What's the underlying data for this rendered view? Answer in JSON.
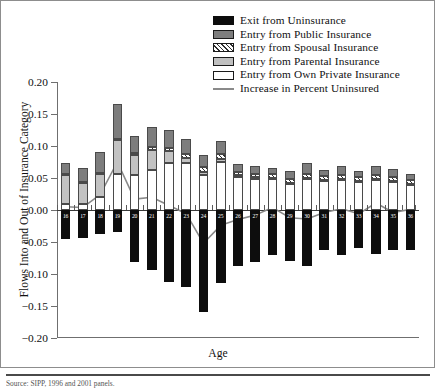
{
  "chart_data": {
    "type": "bar",
    "title": "",
    "xlabel": "Age",
    "ylabel": "Flows Into and Out of Insurance Category",
    "ylim": [
      -0.2,
      0.2
    ],
    "yticks": [
      0.2,
      0.15,
      0.1,
      0.05,
      0.0,
      -0.05,
      -0.1,
      -0.15,
      -0.2
    ],
    "ytick_labels": [
      "0.20",
      "0.15",
      "0.10",
      "0.05",
      "0.00",
      "-0.05",
      "-0.10",
      "-0.15",
      "-0.20"
    ],
    "grid": false,
    "legend_position": "top-right",
    "stacked": true,
    "categories": [
      16,
      17,
      18,
      19,
      20,
      21,
      22,
      23,
      24,
      25,
      26,
      27,
      28,
      29,
      30,
      31,
      32,
      33,
      34,
      35,
      36
    ],
    "xtick_labels": [
      "16",
      "17",
      "18",
      "19",
      "20",
      "21",
      "22",
      "23",
      "24",
      "25",
      "26",
      "27",
      "28",
      "29",
      "30",
      "31",
      "32",
      "33",
      "34",
      "35",
      "36"
    ],
    "series": [
      {
        "name": "Exit from Uninsurance",
        "color": "#0d0d0d",
        "pattern": "solid",
        "values": [
          -0.046,
          -0.043,
          -0.038,
          -0.034,
          -0.082,
          -0.094,
          -0.113,
          -0.121,
          -0.159,
          -0.114,
          -0.088,
          -0.082,
          -0.071,
          -0.079,
          -0.087,
          -0.062,
          -0.07,
          -0.059,
          -0.068,
          -0.063,
          -0.062
        ]
      },
      {
        "name": "Entry from Own Private Insurance",
        "color": "#ffffff",
        "pattern": "open",
        "values": [
          0.01,
          0.009,
          0.021,
          0.057,
          0.054,
          0.063,
          0.074,
          0.073,
          0.054,
          0.075,
          0.051,
          0.049,
          0.049,
          0.041,
          0.049,
          0.046,
          0.047,
          0.045,
          0.048,
          0.045,
          0.04
        ]
      },
      {
        "name": "Entry from Parental Insurance",
        "color": "#c2c2c2",
        "pattern": "light-gray",
        "values": [
          0.046,
          0.034,
          0.036,
          0.052,
          0.032,
          0.031,
          0.018,
          0.009,
          0.006,
          0.005,
          0.003,
          0.002,
          0.001,
          0.001,
          0.001,
          0.001,
          0.001,
          0.001,
          0.001,
          0.001,
          0.001
        ]
      },
      {
        "name": "Entry from Spousal Insurance",
        "color": "#2e2e2e",
        "pattern": "hatch",
        "values": [
          0.001,
          0.001,
          0.001,
          0.002,
          0.003,
          0.004,
          0.005,
          0.006,
          0.007,
          0.007,
          0.006,
          0.006,
          0.006,
          0.006,
          0.006,
          0.006,
          0.006,
          0.006,
          0.006,
          0.006,
          0.006
        ]
      },
      {
        "name": "Entry from Public Insurance",
        "color": "#7d7d7d",
        "pattern": "dark-gray",
        "values": [
          0.017,
          0.021,
          0.032,
          0.054,
          0.026,
          0.032,
          0.028,
          0.023,
          0.019,
          0.021,
          0.012,
          0.011,
          0.01,
          0.013,
          0.017,
          0.009,
          0.015,
          0.009,
          0.013,
          0.012,
          0.01
        ]
      }
    ],
    "line_series": {
      "name": "Increase in Percent Uninsured",
      "color": "#8a8a8a",
      "values": [
        0.005,
        0.004,
        0.024,
        0.075,
        0.017,
        0.02,
        0.007,
        -0.006,
        -0.052,
        -0.024,
        -0.015,
        -0.008,
        0.004,
        -0.012,
        -0.014,
        -0.004,
        0.002,
        -0.006,
        0.011,
        -0.004,
        0.001
      ]
    }
  },
  "legend": {
    "items": [
      {
        "label": "Exit from Uninsurance",
        "swatch": "exit"
      },
      {
        "label": "Entry from Public Insurance",
        "swatch": "public"
      },
      {
        "label": "Entry from Spousal Insurance",
        "swatch": "spousal"
      },
      {
        "label": "Entry from Parental Insurance",
        "swatch": "parental"
      },
      {
        "label": "Entry from Own Private Insurance",
        "swatch": "own"
      },
      {
        "label": "Increase in Percent Uninsured",
        "swatch": "line"
      }
    ]
  },
  "footer": {
    "source": "Source: SIPP, 1996 and 2001 panels."
  }
}
